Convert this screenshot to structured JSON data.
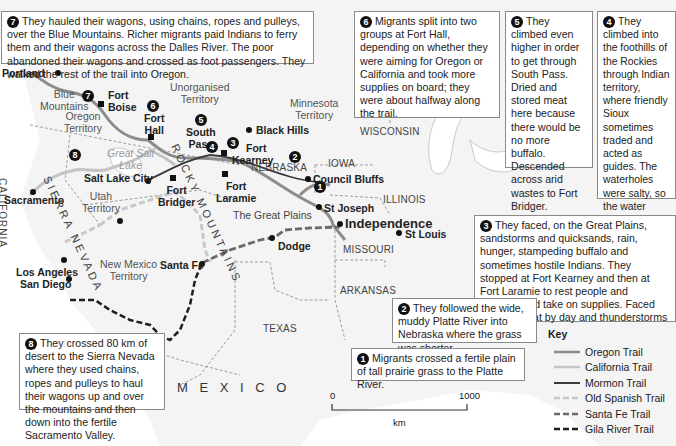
{
  "callouts": [
    {
      "n": "7",
      "text": "They hauled their wagons, using chains, ropes and pulleys, over the Blue Mountains. Richer migrants paid Indians to ferry them and their wagons across the Dalles River. The poor abandoned their wagons and crossed as foot passengers. They walked the rest of the trail into Oregon."
    },
    {
      "n": "6",
      "text": "Migrants split into two groups at Fort Hall, depending on whether they were aiming for Oregon or California and took more supplies on board; they were about halfway along the trail."
    },
    {
      "n": "5",
      "text": "They climbed even higher in order to get through South Pass. Dried and stored meat here because there would be no more buffalo. Descended across arid wastes to Fort Bridger."
    },
    {
      "n": "4",
      "text": "They climbed into the foothills of the Rockies through Indian territory, where friendly Sioux sometimes traded and acted as guides. The waterholes were salty, so the water stored on board at Fort Laramie had to be used for people and animals."
    },
    {
      "n": "3",
      "text": "They faced, on the Great Plains, sandstorms and quicksands, rain, hunger, stampeding buffalo and sometimes hostile Indians. They stopped at Fort Kearney and then at Fort Laramie to rest people and animals, and take on supplies. Faced extreme heat by day and thunderstorms by night."
    },
    {
      "n": "2",
      "text": "They followed the wide, muddy Platte River into Nebraska where the grass was shorter."
    },
    {
      "n": "1",
      "text": "Migrants crossed a fertile plain of tall prairie grass to the Platte River."
    },
    {
      "n": "8",
      "text": "They crossed 80 km of desert to the Sierra Nevada where they used chains, ropes and pulleys to haul their wagons up and over the mountains and then down into the fertile Sacramento Valley."
    }
  ],
  "places": {
    "portland": "Portland",
    "fort_boise_1": "Fort",
    "fort_boise_2": "Boise",
    "fort_hall_1": "Fort",
    "fort_hall_2": "Hall",
    "south_pass_1": "South",
    "south_pass_2": "Pass",
    "fort_kearney_1": "Fort",
    "fort_kearney_2": "Kearney",
    "black_hills": "Black Hills",
    "council_bluffs": "Council Bluffs",
    "salt_lake_city": "Salt Lake City",
    "fort_bridger_1": "Fort",
    "fort_bridger_2": "Bridger",
    "fort_laramie_1": "Fort",
    "fort_laramie_2": "Laramie",
    "sacramento": "Sacramento",
    "st_joseph": "St Joseph",
    "independence": "Independence",
    "st_louis": "St Louis",
    "dodge": "Dodge",
    "santa_fe": "Santa Fe",
    "los_angeles": "Los Angeles",
    "san_diego": "San Diego"
  },
  "regions": {
    "blue_mountains": "Blue\nMountains",
    "oregon_territory": "Oregon\nTerritory",
    "unorganised_territory": "Unorganised\nTerritory",
    "minnesota_territory": "Minnesota\nTerritory",
    "wisconsin": "WISCONSIN",
    "iowa": "IOWA",
    "nebraska": "NEBRASKA",
    "illinois": "ILLINOIS",
    "missouri": "MISSOURI",
    "arkansas": "ARKANSAS",
    "texas": "TEXAS",
    "mexico": "M E X I C O",
    "california": "CALIFORNIA",
    "sierra_nevada": "SIERRA NEVADA",
    "rocky_mountains": "ROCKY MOUNTAINS",
    "utah_territory": "Utah\nTerritory",
    "new_mexico_territory": "New Mexico\nTerritory",
    "great_plains": "The Great Plains",
    "great_salt_lake": "Great Salt\nLake"
  },
  "markers": {
    "m7": "7",
    "m6": "6",
    "m5": "5",
    "m4": "4",
    "m3": "3",
    "m2": "2",
    "m1": "1",
    "m8": "8"
  },
  "scale": {
    "start": "0",
    "end": "1000",
    "unit": "km"
  },
  "key": {
    "title": "Key",
    "items": [
      {
        "label": "Oregon Trail",
        "color": "#8c8c8c",
        "style": "solid"
      },
      {
        "label": "California Trail",
        "color": "#c4c4c4",
        "style": "solid"
      },
      {
        "label": "Mormon Trail",
        "color": "#3a3a3a",
        "style": "solid"
      },
      {
        "label": "Old Spanish Trail",
        "color": "#c8c8c8",
        "style": "dashed"
      },
      {
        "label": "Santa Fe Trail",
        "color": "#6a6a6a",
        "style": "dashed"
      },
      {
        "label": "Gila River Trail",
        "color": "#1e1e1e",
        "style": "dashed"
      }
    ]
  },
  "colors": {
    "land": "#f4f4f4",
    "water": "#ffffff",
    "oregon_trail": "#8c8c8c",
    "california_trail": "#c4c4c4",
    "mormon_trail": "#3a3a3a",
    "old_spanish_trail": "#c8c8c8",
    "santa_fe_trail": "#6a6a6a",
    "gila_river_trail": "#1e1e1e"
  }
}
